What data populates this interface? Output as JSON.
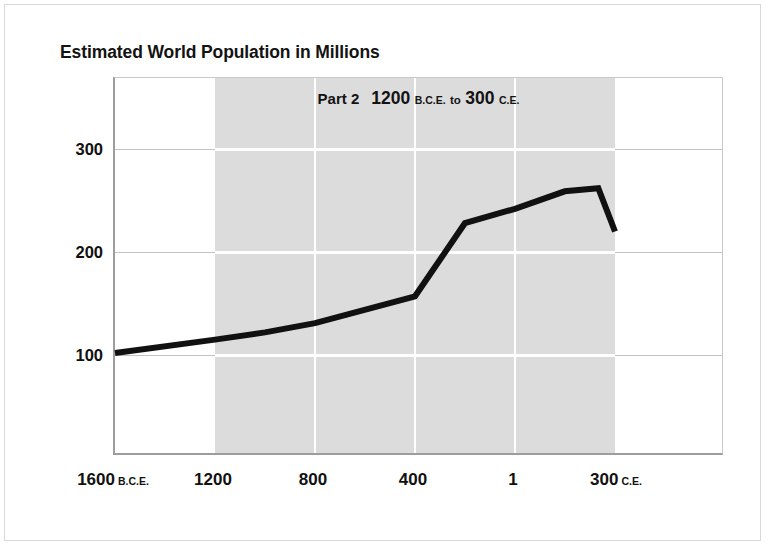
{
  "page": {
    "background_color": "#ffffff",
    "frame_color": "#d9d9d9"
  },
  "header": {
    "title": "Estimated World Population in Millions"
  },
  "chart_data": {
    "type": "line",
    "title": "Estimated World Population in Millions",
    "subtitle": {
      "part_label": "Part 2",
      "range_start_year": "1200",
      "range_start_era": "B.C.E.",
      "connector": "to",
      "range_end_year": "300",
      "range_end_era": "C.E."
    },
    "xlabel": "",
    "ylabel": "",
    "ylim": [
      0,
      378
    ],
    "yticks": [
      100,
      200,
      300
    ],
    "ytick_labels": [
      "100",
      "200",
      "300"
    ],
    "xticks": [
      -1600,
      -1200,
      -800,
      -400,
      1,
      300
    ],
    "xtick_labels": [
      {
        "num": "1600",
        "era": "B.C.E."
      },
      {
        "num": "1200",
        "era": ""
      },
      {
        "num": "800",
        "era": ""
      },
      {
        "num": "400",
        "era": ""
      },
      {
        "num": "1",
        "era": ""
      },
      {
        "num": "300",
        "era": "C.E."
      }
    ],
    "grid": true,
    "grid_color_light": "#c2c2c2",
    "grid_color_on_band": "#ffffff",
    "shaded_band": {
      "from_label": "1200 B.C.E.",
      "to_label": "300 C.E.",
      "color": "#dcdcdc"
    },
    "legend": null,
    "series": [
      {
        "name": "Estimated world population",
        "color": "#111111",
        "line_width": 6,
        "x": [
          -1600,
          -1200,
          -1000,
          -800,
          -400,
          -200,
          1,
          150,
          250,
          300
        ],
        "values": [
          100,
          113,
          120,
          129,
          155,
          226,
          240,
          257,
          260,
          218
        ]
      }
    ]
  }
}
